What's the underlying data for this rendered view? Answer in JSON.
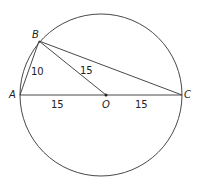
{
  "diagram": {
    "points": {
      "A": {
        "label": "A"
      },
      "B": {
        "label": "B"
      },
      "C": {
        "label": "C"
      },
      "O": {
        "label": "O"
      }
    },
    "segments": {
      "AB": "10",
      "BO": "15",
      "AO": "15",
      "OC": "15"
    },
    "colors": {
      "stroke": "#333333",
      "background": "#ffffff"
    }
  }
}
